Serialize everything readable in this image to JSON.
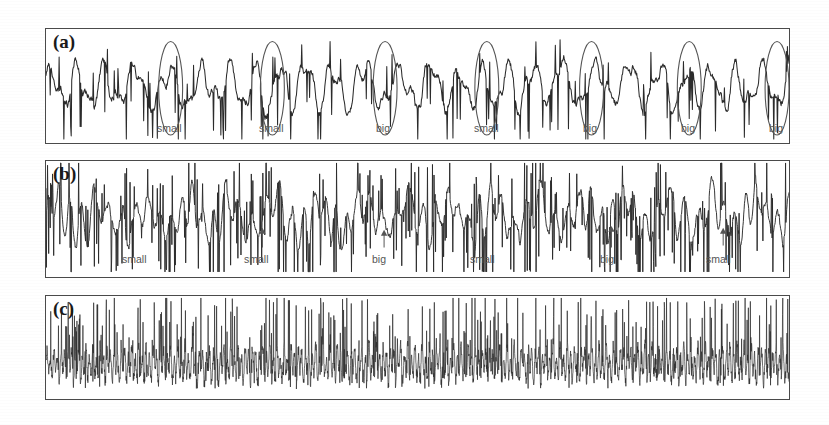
{
  "figure": {
    "background_color": "#ffffff",
    "trace_color": "#2b2b2b",
    "border_color": "#4a4a4a",
    "annotation_color": "#555555"
  },
  "panels": [
    {
      "id": "panel-a",
      "label": "(a)",
      "x": 45,
      "y": 28,
      "w": 745,
      "h": 116,
      "annotation_kind": "ellipse",
      "events": [
        {
          "label": "small",
          "x": 170,
          "label_x": 157,
          "label_y": 122
        },
        {
          "label": "small",
          "x": 272,
          "label_x": 259,
          "label_y": 122
        },
        {
          "label": "big",
          "x": 385,
          "label_x": 376,
          "label_y": 122
        },
        {
          "label": "small",
          "x": 487,
          "label_x": 474,
          "label_y": 122
        },
        {
          "label": "big",
          "x": 592,
          "label_x": 583,
          "label_y": 122
        },
        {
          "label": "big",
          "x": 690,
          "label_x": 681,
          "label_y": 122
        },
        {
          "label": "big",
          "x": 778,
          "label_x": 769,
          "label_y": 122
        }
      ]
    },
    {
      "id": "panel-b",
      "label": "(b)",
      "x": 45,
      "y": 160,
      "w": 745,
      "h": 118,
      "annotation_kind": "arrow",
      "events": [
        {
          "label": "small",
          "x": 140,
          "label_x": 122,
          "label_y": 253,
          "arrow": false
        },
        {
          "label": "small",
          "x": 262,
          "label_x": 244,
          "label_y": 253,
          "arrow": true,
          "arrow_top": 228,
          "arrow_bottom": 248
        },
        {
          "label": "big",
          "x": 384,
          "label_x": 372,
          "label_y": 253,
          "arrow": true,
          "arrow_top": 230,
          "arrow_bottom": 248
        },
        {
          "label": "small",
          "x": 488,
          "label_x": 470,
          "label_y": 253,
          "arrow": false
        },
        {
          "label": "big",
          "x": 612,
          "label_x": 600,
          "label_y": 253,
          "arrow": true,
          "arrow_top": 226,
          "arrow_bottom": 248
        },
        {
          "label": "small",
          "x": 724,
          "label_x": 706,
          "label_y": 253,
          "arrow": true,
          "arrow_top": 228,
          "arrow_bottom": 246
        }
      ]
    },
    {
      "id": "panel-c",
      "label": "(c)",
      "x": 45,
      "y": 295,
      "w": 745,
      "h": 105,
      "annotation_kind": "none",
      "events": []
    }
  ],
  "chart_data": {
    "type": "line",
    "title": "",
    "xlabel": "",
    "ylabel": "",
    "grid": false,
    "legend": "none",
    "series": [
      {
        "name": "(a)",
        "ylim": [
          -1,
          1
        ],
        "annotations": [
          "small",
          "small",
          "big",
          "small",
          "big",
          "big",
          "big"
        ],
        "values": [
          0.05,
          -0.12,
          0.3,
          -0.05,
          0.22,
          -0.4,
          0.1,
          0.38,
          -0.18,
          0.05,
          0.44,
          -0.1,
          0.18,
          -0.62,
          0.26,
          0.08,
          -0.3,
          0.5,
          -0.14,
          0.3,
          -0.48,
          0.16,
          0.62,
          -0.22,
          0.12,
          -0.34,
          0.4,
          -0.08,
          0.24,
          -0.58,
          0.34,
          0.1,
          -0.26,
          0.46,
          -0.16,
          0.28,
          -0.44,
          0.2,
          0.66,
          -0.3,
          0.08,
          -0.38,
          0.36,
          -0.06,
          0.3,
          -0.54,
          0.42,
          0.14,
          -0.24,
          0.52,
          -0.2,
          0.34,
          -0.46,
          0.24,
          0.7,
          -0.28,
          0.1,
          -0.36,
          0.44,
          -0.12,
          0.26,
          -0.6,
          0.38,
          0.06,
          -0.32,
          0.48,
          -0.18,
          0.32,
          -0.5,
          0.22,
          0.64,
          -0.26,
          0.14,
          -0.4,
          0.42,
          -0.1,
          0.28,
          -0.56,
          0.36,
          0.12,
          -0.22,
          0.54,
          -0.16,
          0.3,
          -0.42,
          0.26,
          0.68,
          -0.24,
          0.08,
          -0.34,
          0.46,
          -0.14,
          0.24,
          -0.52,
          0.4,
          0.16,
          -0.28,
          0.5,
          -0.2,
          0.32
        ]
      },
      {
        "name": "(b)",
        "ylim": [
          -1,
          1
        ],
        "annotations": [
          "small",
          "small",
          "big",
          "small",
          "big",
          "small"
        ],
        "values": [
          0.04,
          -0.3,
          0.55,
          -0.45,
          0.2,
          -0.65,
          0.48,
          0.1,
          -0.38,
          0.72,
          -0.52,
          0.26,
          -0.7,
          0.4,
          0.14,
          -0.44,
          0.6,
          -0.36,
          0.3,
          -0.76,
          0.52,
          0.08,
          -0.42,
          0.66,
          -0.48,
          0.22,
          -0.62,
          0.44,
          0.18,
          -0.34,
          0.58,
          -0.54,
          0.28,
          -0.72,
          0.5,
          0.12,
          -0.4,
          0.68,
          -0.46,
          0.24,
          -0.66,
          0.42,
          0.16,
          -0.36,
          0.62,
          -0.5,
          0.32,
          -0.74,
          0.54,
          0.06,
          -0.44,
          0.7,
          -0.42,
          0.2,
          -0.68,
          0.46,
          0.14,
          -0.38,
          0.64,
          -0.56,
          0.26,
          -0.78,
          0.48,
          0.1,
          -0.46,
          0.72,
          -0.4,
          0.3,
          -0.6,
          0.44,
          0.18,
          -0.32,
          0.58,
          -0.52,
          0.28,
          -0.7,
          0.52,
          0.08,
          -0.48,
          0.66,
          -0.44,
          0.22,
          -0.64,
          0.4,
          0.16,
          -0.36,
          0.62,
          -0.5,
          0.34,
          -0.76,
          0.56,
          0.12,
          -0.42,
          0.68,
          -0.38,
          0.24,
          -0.58,
          0.46,
          0.2,
          -0.3,
          0.6,
          -0.54
        ]
      },
      {
        "name": "(c)",
        "ylim": [
          -1,
          1
        ],
        "annotations": [],
        "values": [
          0.1,
          -0.22,
          0.46,
          -0.26,
          0.14,
          -0.3,
          0.58,
          -0.2,
          0.1,
          -0.28,
          0.66,
          -0.24,
          0.12,
          -0.32,
          0.52,
          -0.18,
          0.08,
          -0.26,
          0.74,
          -0.22,
          0.14,
          -0.3,
          0.48,
          -0.2,
          0.1,
          -0.24,
          0.62,
          -0.28,
          0.12,
          -0.34,
          0.56,
          -0.18,
          0.08,
          -0.22,
          0.7,
          -0.26,
          0.16,
          -0.3,
          0.44,
          -0.2,
          0.1,
          -0.28,
          0.64,
          -0.24,
          0.12,
          -0.32,
          0.5,
          -0.16,
          0.08,
          -0.26,
          0.78,
          -0.22,
          0.14,
          -0.3,
          0.54,
          -0.2,
          0.1,
          -0.24,
          0.6,
          -0.28,
          0.12,
          -0.34,
          0.46,
          -0.18,
          0.08,
          -0.22,
          0.72,
          -0.26,
          0.16,
          -0.3,
          0.52,
          -0.2,
          0.1,
          -0.28,
          0.68,
          -0.24,
          0.12,
          -0.32,
          0.48,
          -0.16,
          0.08,
          -0.26,
          0.76,
          -0.22,
          0.14,
          -0.3,
          0.56,
          -0.2,
          0.1,
          -0.24,
          0.62,
          -0.28,
          0.12,
          -0.34,
          0.5,
          -0.18,
          0.08,
          -0.22,
          0.8,
          -0.26
        ]
      }
    ]
  }
}
